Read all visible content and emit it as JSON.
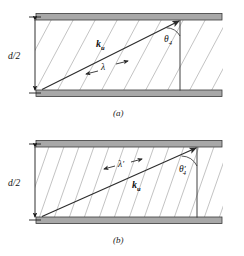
{
  "figure": {
    "type": "physics-diagram",
    "colors": {
      "wall_fill": "#a8a8a8",
      "wall_stroke": "#3a3a3a",
      "wavefront": "#b9b9b9",
      "ray": "#2b2b2b",
      "text": "#111111",
      "background": "#ffffff"
    }
  },
  "panels": [
    {
      "id": "a",
      "caption": "(a)",
      "dimension_label": "d/2",
      "wavevector_label": "k",
      "wavevector_subscript": "u",
      "wavelength_label": "λ",
      "wavelength_prime": "",
      "angle_label": "θ",
      "angle_prime": "",
      "angle_subscript": "4",
      "wavefront_count": 11,
      "wavefront_spacing_px": 22,
      "wavefront_angle_deg": 62,
      "ray_angle_deg": 38
    },
    {
      "id": "b",
      "caption": "(b)",
      "dimension_label": "d/2",
      "wavevector_label": "k",
      "wavevector_subscript": "u",
      "wavelength_label": "λ",
      "wavelength_prime": "′",
      "angle_label": "θ",
      "angle_prime": "′",
      "angle_subscript": "4",
      "wavefront_count": 15,
      "wavefront_spacing_px": 15,
      "wavefront_angle_deg": 72,
      "ray_angle_deg": 25
    }
  ]
}
